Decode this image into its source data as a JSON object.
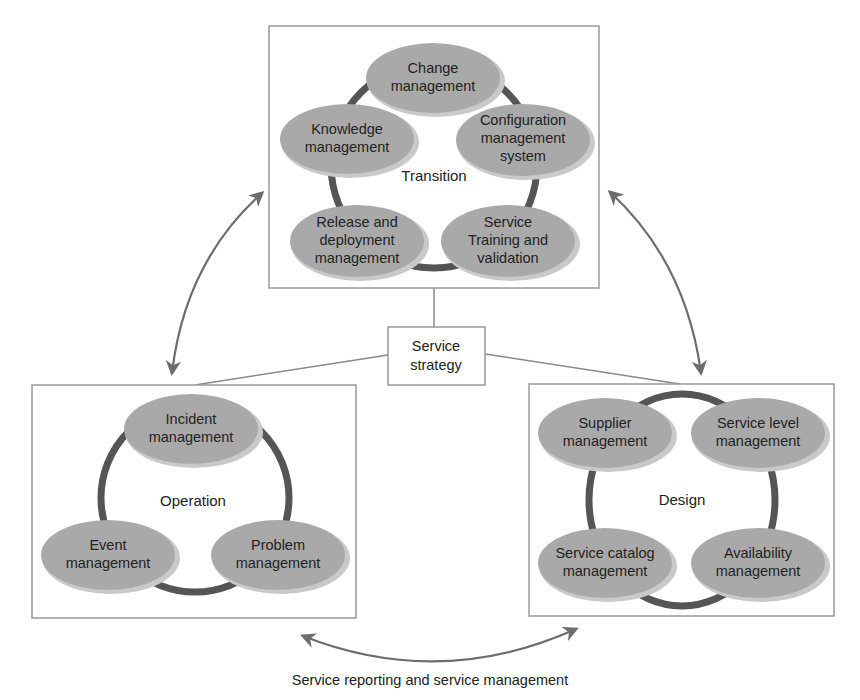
{
  "diagram": {
    "type": "ITIL service lifecycle",
    "center": {
      "label_line1": "Service",
      "label_line2": "strategy"
    },
    "phases": [
      {
        "id": "transition",
        "label": "Transition",
        "nodes": [
          {
            "lines": [
              "Change",
              "management"
            ]
          },
          {
            "lines": [
              "Configuration",
              "management",
              "system"
            ]
          },
          {
            "lines": [
              "Service",
              "Training and",
              "validation"
            ]
          },
          {
            "lines": [
              "Release and",
              "deployment",
              "management"
            ]
          },
          {
            "lines": [
              "Knowledge",
              "management"
            ]
          }
        ]
      },
      {
        "id": "operation",
        "label": "Operation",
        "nodes": [
          {
            "lines": [
              "Incident",
              "management"
            ]
          },
          {
            "lines": [
              "Problem",
              "management"
            ]
          },
          {
            "lines": [
              "Event",
              "management"
            ]
          }
        ]
      },
      {
        "id": "design",
        "label": "Design",
        "nodes": [
          {
            "lines": [
              "Supplier",
              "management"
            ]
          },
          {
            "lines": [
              "Service level",
              "management"
            ]
          },
          {
            "lines": [
              "Availability",
              "management"
            ]
          },
          {
            "lines": [
              "Service catalog",
              "management"
            ]
          }
        ]
      }
    ],
    "relationships": [
      {
        "from": "operation",
        "to": "transition",
        "kind": "bidirectional-arrow"
      },
      {
        "from": "transition",
        "to": "design",
        "kind": "bidirectional-arrow"
      },
      {
        "from": "operation",
        "to": "design",
        "kind": "bidirectional-arrow"
      },
      {
        "from": "strategy",
        "to": "transition",
        "kind": "connector-line"
      },
      {
        "from": "strategy",
        "to": "operation",
        "kind": "connector-line"
      },
      {
        "from": "strategy",
        "to": "design",
        "kind": "connector-line"
      }
    ],
    "caption": {
      "line1": "Service reporting and service management"
    },
    "colors": {
      "node_fill": "#a9a9a9",
      "ring": "#555555",
      "panel_border": "#9a9a9a",
      "arrow": "#6d6d6d"
    }
  }
}
